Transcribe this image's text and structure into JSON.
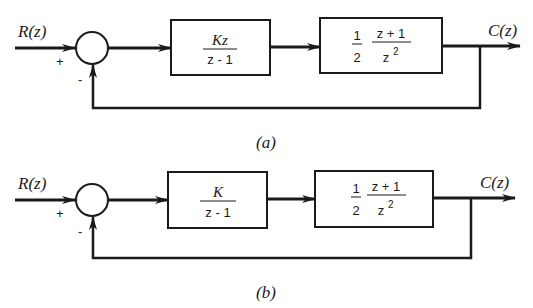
{
  "diagrams": [
    {
      "id": "a",
      "caption": "(a)",
      "input_label": "R(z)",
      "output_label": "C(z)",
      "summing_junction": {
        "plus_sign": "+",
        "minus_sign": "-"
      },
      "block1": {
        "numerator": "Kz",
        "denominator": "z - 1"
      },
      "block2": {
        "gain": "1",
        "gain_den": "2",
        "numerator": "z + 1",
        "denominator": "z",
        "den_exponent": "2"
      }
    },
    {
      "id": "b",
      "caption": "(b)",
      "input_label": "R(z)",
      "output_label": "C(z)",
      "summing_junction": {
        "plus_sign": "+",
        "minus_sign": "-"
      },
      "block1": {
        "numerator": "K",
        "denominator": "z - 1"
      },
      "block2": {
        "gain": "1",
        "gain_den": "2",
        "numerator": "z + 1",
        "denominator": "z",
        "den_exponent": "2"
      }
    }
  ]
}
